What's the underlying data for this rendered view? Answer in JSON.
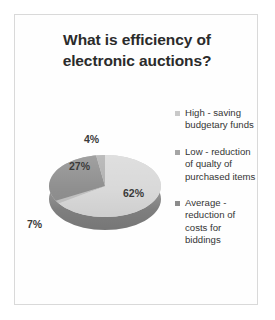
{
  "chart_data": {
    "type": "pie",
    "title": "What is efficiency of electronic auctions?",
    "title_lines": [
      "What is efficiency of",
      "electronic auctions?"
    ],
    "categories": [
      "High - saving budgetary funds",
      "Low - reduction of qualty of purchased items",
      "Average - reduction of costs for biddings"
    ],
    "values": [
      62,
      27,
      7
    ],
    "labels": [
      "62%",
      "27%",
      "7%",
      "4%"
    ],
    "extra_slice_value": 4,
    "extra_slice_label": "4%",
    "unit": "%",
    "legend_position": "right",
    "three_d": true,
    "grid": false,
    "colors": {
      "high": "#d9d9d9",
      "low": "#8f8f8f",
      "average": "#c2c2c2",
      "fourth": "#b0b0b0",
      "depth": "#8d8d8d",
      "title_text": "#2b2b2b",
      "label_text": "#3a3a3a",
      "frame_border": "#d9d9d9"
    }
  },
  "legend": {
    "items": [
      {
        "label": "High - saving budgetary funds",
        "marker": "square-marker"
      },
      {
        "label": "Low - reduction of qualty of purchased items",
        "marker": "square-marker"
      },
      {
        "label": "Average - reduction of costs for biddings",
        "marker": "square-marker"
      }
    ]
  }
}
